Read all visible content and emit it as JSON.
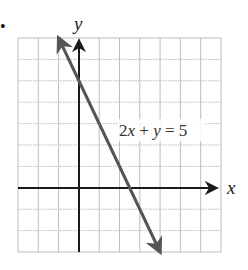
{
  "figure": {
    "bullet": "•",
    "x_axis_label": "x",
    "y_axis_label": "y",
    "equation_label": {
      "parts": [
        "2",
        "x",
        " + ",
        "y",
        " = 5"
      ],
      "full": "2x + y = 5"
    },
    "colors": {
      "grid": "#bdbdbd",
      "axis": "#1a1a1a",
      "line": "#555555",
      "background": "#ffffff"
    }
  },
  "chart_data": {
    "type": "line",
    "title": "",
    "xlabel": "x",
    "ylabel": "y",
    "xlim": [
      -3,
      7
    ],
    "ylim": [
      -3,
      7
    ],
    "grid": true,
    "grid_step": 1,
    "tick_labels_shown": false,
    "series": [
      {
        "name": "2x + y = 5",
        "equation": "2x + y = 5",
        "slope": -2,
        "y_intercept": 5,
        "x": [
          -1,
          0,
          1,
          2,
          2.5,
          3,
          4
        ],
        "y": [
          7,
          5,
          3,
          1,
          0,
          -1,
          -3
        ],
        "arrows_both_ends": true
      }
    ],
    "annotations": [
      {
        "text": "2x + y = 5",
        "position": "right of line, near (2, 3)"
      }
    ],
    "legend": null
  }
}
